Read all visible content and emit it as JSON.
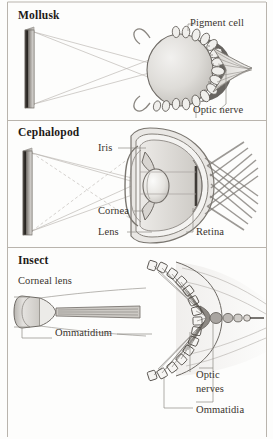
{
  "figure": {
    "background_color": "#fdfdfc",
    "ink_color": "#2b2723",
    "panel_divider_color": "#b9b4ad",
    "panels": [
      {
        "id": "mollusk",
        "heading": "Mollusk",
        "labels": [
          {
            "id": "pigment-cell",
            "text": "Pigment cell"
          },
          {
            "id": "optic-nerve",
            "text": "Optic nerve"
          }
        ]
      },
      {
        "id": "cephalopod",
        "heading": "Cephalopod",
        "labels": [
          {
            "id": "iris",
            "text": "Iris"
          },
          {
            "id": "cornea",
            "text": "Cornea"
          },
          {
            "id": "lens",
            "text": "Lens"
          },
          {
            "id": "retina",
            "text": "Retina"
          }
        ]
      },
      {
        "id": "insect",
        "heading": "Insect",
        "labels": [
          {
            "id": "corneal-lens",
            "text": "Corneal lens"
          },
          {
            "id": "ommatidium",
            "text": "Ommatidium"
          },
          {
            "id": "optic-nerves-line1",
            "text": "Optic"
          },
          {
            "id": "optic-nerves-line2",
            "text": "nerves"
          },
          {
            "id": "ommatidia",
            "text": "Ommatidia"
          }
        ]
      }
    ]
  }
}
